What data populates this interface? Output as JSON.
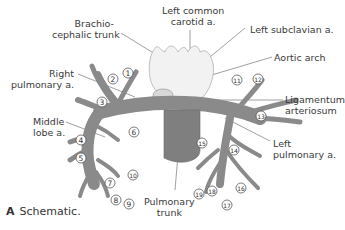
{
  "figure": {
    "panel_letter": "A",
    "caption": "Schematic.",
    "colors": {
      "vessel": "#8a8a8a",
      "vessel_dark": "#6e6e6e",
      "aorta": "#f1f1f1",
      "aorta_outline": "#b5b5b5",
      "leader_line": "#666666",
      "text": "#3a3a3a"
    },
    "labels": {
      "left_common_carotid": [
        "Left common",
        "carotid a."
      ],
      "brachiocephalic": [
        "Brachio-",
        "cephalic trunk"
      ],
      "left_subclavian": "Left subclavian a.",
      "right_pulmonary": [
        "Right",
        "pulmonary a."
      ],
      "aortic_arch": "Aortic arch",
      "ligamentum": [
        "Ligamentum",
        "arteriosum"
      ],
      "middle_lobe": [
        "Middle",
        "lobe a."
      ],
      "left_pulmonary": [
        "Left",
        "pulmonary a."
      ],
      "pulmonary_trunk": [
        "Pulmonary",
        "trunk"
      ]
    },
    "numbers": [
      "1",
      "2",
      "3",
      "4",
      "5",
      "6",
      "7",
      "8",
      "9",
      "10",
      "11",
      "12",
      "13",
      "14",
      "15",
      "16",
      "17",
      "18",
      "19"
    ]
  }
}
